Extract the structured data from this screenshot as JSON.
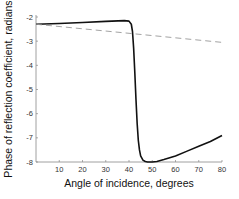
{
  "chart_data": {
    "type": "line",
    "title": "",
    "xlabel": "Angle of incidence, degrees",
    "ylabel": "Phase of reflection coefficient, radians",
    "xlim": [
      0,
      80
    ],
    "ylim": [
      -8,
      -2
    ],
    "xticks": [
      10,
      20,
      30,
      40,
      50,
      60,
      70,
      80
    ],
    "yticks": [
      -2,
      -3,
      -4,
      -5,
      -6,
      -7,
      -8
    ],
    "grid": false,
    "legend": null,
    "series": [
      {
        "name": "solid",
        "style": "solid",
        "color": "#111111",
        "x": [
          0,
          10,
          20,
          30,
          38,
          40,
          41,
          41.5,
          42,
          42.5,
          43,
          43.5,
          44,
          44.5,
          45,
          46,
          47,
          48,
          50,
          52,
          55,
          60,
          65,
          70,
          75,
          80
        ],
        "y": [
          -2.3,
          -2.27,
          -2.23,
          -2.18,
          -2.15,
          -2.17,
          -2.3,
          -2.6,
          -3.3,
          -4.3,
          -5.4,
          -6.4,
          -7.1,
          -7.5,
          -7.75,
          -7.92,
          -7.98,
          -8.0,
          -8.0,
          -7.98,
          -7.9,
          -7.75,
          -7.55,
          -7.35,
          -7.15,
          -6.9
        ]
      },
      {
        "name": "dashed",
        "style": "dashed",
        "color": "#999999",
        "x": [
          0,
          80
        ],
        "y": [
          -2.3,
          -3.05
        ]
      }
    ]
  }
}
